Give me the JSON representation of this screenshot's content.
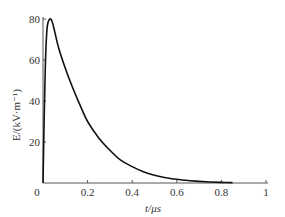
{
  "chart_data": {
    "type": "line",
    "title": "",
    "xlabel": "t/μs",
    "ylabel": "E/(kV·m⁻¹)",
    "xlim": [
      0,
      1
    ],
    "ylim": [
      0,
      80
    ],
    "grid": false,
    "legend": null,
    "x_ticks": [
      "0",
      "0.2",
      "0.4",
      "0.6",
      "0.8",
      "1"
    ],
    "y_ticks": [
      "20",
      "40",
      "60",
      "80"
    ],
    "series": [
      {
        "name": "E(t)",
        "color": "#111111",
        "x": [
          0.0,
          0.005,
          0.01,
          0.015,
          0.02,
          0.03,
          0.04,
          0.05,
          0.07,
          0.1,
          0.135,
          0.17,
          0.2,
          0.25,
          0.3,
          0.35,
          0.4,
          0.45,
          0.5,
          0.55,
          0.6,
          0.65,
          0.7,
          0.75,
          0.8,
          0.85
        ],
        "y": [
          0,
          30,
          55,
          70,
          77,
          80,
          79,
          75,
          66,
          56,
          46,
          37,
          30,
          22,
          16,
          11,
          8,
          5.5,
          3.8,
          2.6,
          1.8,
          1.2,
          0.8,
          0.5,
          0.3,
          0.2
        ]
      }
    ]
  }
}
